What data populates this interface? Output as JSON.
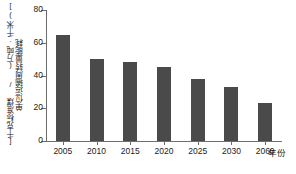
{
  "chart_data": {
    "type": "bar",
    "title": "",
    "subtitle": "",
    "categories": [
      "2005",
      "2010",
      "2015",
      "2020",
      "2025",
      "2030",
      "2060"
    ],
    "values": [
      65,
      50,
      48,
      45,
      38,
      33,
      23
    ],
    "xlabel": "年份",
    "ylabel": "单位运输周转量能耗",
    "ylabel_unit": "[千克标准煤 / (万吨·千米)]",
    "ylim": [
      0,
      80
    ],
    "yticks": [
      "0",
      "20",
      "40",
      "60",
      "80"
    ],
    "ytick_values": [
      0,
      20,
      40,
      60,
      80
    ],
    "grid": false,
    "legend": null,
    "bar_color": "#4a4a4a",
    "axis_color": "#6e6e6e",
    "text_color": "#1a1a1a",
    "background": "#ffffff"
  }
}
